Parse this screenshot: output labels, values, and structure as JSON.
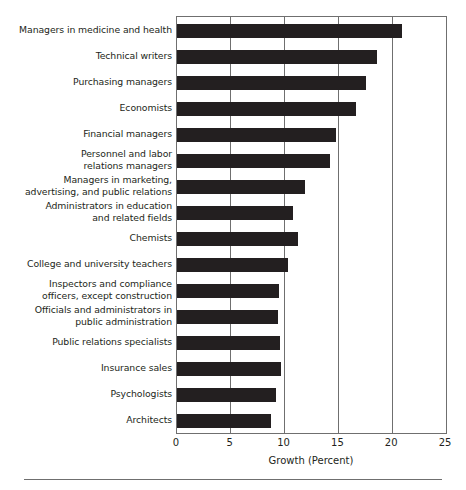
{
  "chart_data": {
    "type": "bar",
    "orientation": "horizontal",
    "title": "",
    "xlabel": "Growth (Percent)",
    "ylabel": "",
    "xlim": [
      0,
      25
    ],
    "xticks": [
      0,
      5,
      10,
      15,
      20,
      25
    ],
    "grid": true,
    "legend": null,
    "bar_color": "#231f20",
    "axis_color": "#6f6f6f",
    "categories": [
      "Managers in medicine and health",
      "Technical writers",
      "Purchasing managers",
      "Economists",
      "Financial managers",
      "Personnel and labor\nrelations managers",
      "Managers in marketing,\nadvertising, and public relations",
      "Administrators in education\nand related fields",
      "Chemists",
      "College and university teachers",
      "Inspectors and compliance\nofficers, except construction",
      "Officials and administrators in\npublic administration",
      "Public relations specialists",
      "Insurance sales",
      "Psychologists",
      "Architects"
    ],
    "values": [
      20.9,
      18.6,
      17.6,
      16.6,
      14.8,
      14.2,
      11.9,
      10.8,
      11.2,
      10.3,
      9.5,
      9.4,
      9.6,
      9.7,
      9.2,
      8.7
    ]
  }
}
